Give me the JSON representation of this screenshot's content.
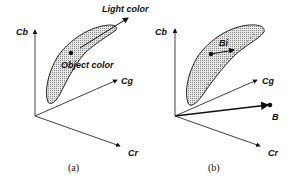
{
  "panels": [
    {
      "id": "a",
      "caption": "(a)",
      "axes": {
        "y": "Cb",
        "depth": "Cg",
        "x": "Cr"
      },
      "annotations": {
        "light": "Light color",
        "object": "Object color"
      }
    },
    {
      "id": "b",
      "caption": "(b)",
      "axes": {
        "y": "Cb",
        "depth": "Cg",
        "x": "Cr"
      },
      "annotations": {
        "vector_in_region": "Bi",
        "external_vector": "B"
      }
    }
  ],
  "colors": {
    "stroke": "#111111",
    "region_fill": "#c8c8c8"
  }
}
